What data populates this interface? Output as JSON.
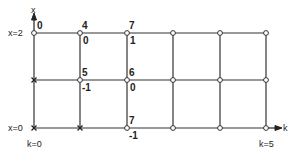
{
  "axes": {
    "vertical_label": "x",
    "horizontal_label": "k",
    "x_top_label": "x=2",
    "x_bottom_label": "x=0",
    "k_left_label": "k=0",
    "k_right_label": "k=5"
  },
  "grid": {
    "columns": [
      34,
      80,
      127,
      173,
      220,
      266
    ],
    "rows": [
      33,
      80,
      128
    ],
    "line_color": "#333333"
  },
  "nodes": [
    {
      "col": 0,
      "row": 0,
      "type": "open"
    },
    {
      "col": 1,
      "row": 0,
      "type": "open"
    },
    {
      "col": 2,
      "row": 0,
      "type": "open"
    },
    {
      "col": 3,
      "row": 0,
      "type": "open"
    },
    {
      "col": 4,
      "row": 0,
      "type": "open"
    },
    {
      "col": 5,
      "row": 0,
      "type": "open"
    },
    {
      "col": 0,
      "row": 1,
      "type": "cross"
    },
    {
      "col": 1,
      "row": 1,
      "type": "open"
    },
    {
      "col": 2,
      "row": 1,
      "type": "open"
    },
    {
      "col": 3,
      "row": 1,
      "type": "open"
    },
    {
      "col": 4,
      "row": 1,
      "type": "open"
    },
    {
      "col": 5,
      "row": 1,
      "type": "open"
    },
    {
      "col": 0,
      "row": 2,
      "type": "cross"
    },
    {
      "col": 1,
      "row": 2,
      "type": "cross"
    },
    {
      "col": 2,
      "row": 2,
      "type": "open"
    },
    {
      "col": 3,
      "row": 2,
      "type": "open"
    },
    {
      "col": 4,
      "row": 2,
      "type": "open"
    },
    {
      "col": 5,
      "row": 2,
      "type": "open"
    }
  ],
  "node_annotations": {
    "n00_above": "0",
    "n10_above": "4",
    "n10_below": "0",
    "n20_above": "7",
    "n20_below": "1",
    "n11_above": "5",
    "n11_below": "-1",
    "n21_above": "6",
    "n21_below": "0",
    "n22_above": "7",
    "n22_below": "-1"
  }
}
